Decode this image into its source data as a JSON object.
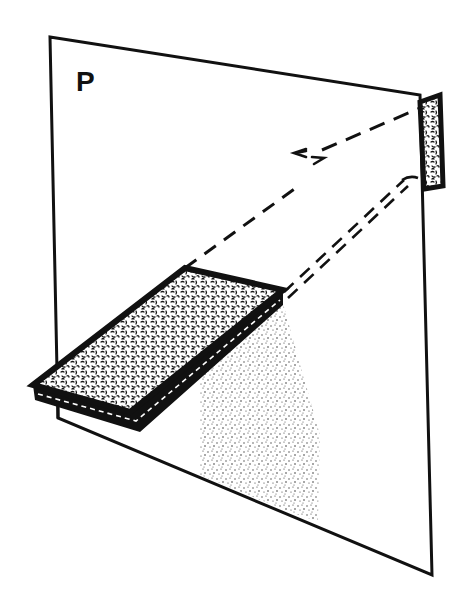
{
  "figure": {
    "plane_label": "P",
    "colors": {
      "ink": "#111111",
      "background": "#ffffff",
      "stipple": "#222222"
    },
    "elements": [
      {
        "name": "plane",
        "label": "P",
        "shape": "quadrilateral"
      },
      {
        "name": "slab",
        "shape": "textured-rectangle-prism"
      },
      {
        "name": "target-rect",
        "shape": "textured-small-rectangle"
      },
      {
        "name": "eye-symbol",
        "shape": "eye-glyph"
      },
      {
        "name": "sight-line",
        "style": "dashed"
      },
      {
        "name": "double-projection-line",
        "style": "double-dashed"
      },
      {
        "name": "shadow",
        "style": "stippled"
      }
    ]
  }
}
